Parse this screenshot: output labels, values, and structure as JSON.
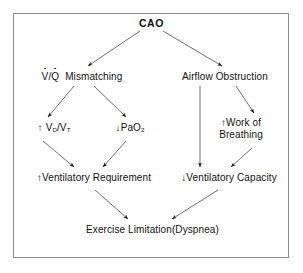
{
  "figure": {
    "type": "flowchart",
    "border_color": "#8c8c8c",
    "background": "#ffffff",
    "text_color": "#111111"
  },
  "nodes": {
    "cao": {
      "label": "CAO",
      "id": "cao"
    },
    "vq_mismatching": {
      "prefix": "V",
      "divider": "/",
      "second": "Q",
      "label": "Mismatching",
      "full": "V̇/Q̇ Mismatching"
    },
    "airflow_obstruction": {
      "label": "Airflow  Obstruction"
    },
    "vd_vt": {
      "arrow": "↑",
      "main_a": "V",
      "sub_a": "D",
      "slash": "/",
      "main_b": "V",
      "sub_b": "T",
      "full": "↑ V_D/V_T"
    },
    "pao2": {
      "arrow": "↓",
      "label": "PaO",
      "sub": "2",
      "full": "↓PaO₂"
    },
    "work_of_breathing": {
      "arrow": "↑",
      "line1": "Work  of",
      "line2": "Breathing",
      "full": "↑ Work of Breathing"
    },
    "ventilatory_requirement": {
      "arrow": "↑",
      "label": "Ventilatory  Requirement",
      "full": "↑Ventilatory Requirement"
    },
    "ventilatory_capacity": {
      "arrow": "↓",
      "label": "Ventilatory  Capacity",
      "full": "↓Ventilatory Capacity"
    },
    "exercise_limitation": {
      "label": "Exercise  Limitation",
      "paren": "(Dyspnea)",
      "full": "Exercise Limitation(Dyspnea)"
    }
  },
  "edges": [
    {
      "from": "cao",
      "to": "vq_mismatching"
    },
    {
      "from": "cao",
      "to": "airflow_obstruction"
    },
    {
      "from": "vq_mismatching",
      "to": "vd_vt"
    },
    {
      "from": "vq_mismatching",
      "to": "pao2"
    },
    {
      "from": "vd_vt",
      "to": "ventilatory_requirement"
    },
    {
      "from": "pao2",
      "to": "ventilatory_requirement"
    },
    {
      "from": "airflow_obstruction",
      "to": "work_of_breathing"
    },
    {
      "from": "airflow_obstruction",
      "to": "ventilatory_capacity"
    },
    {
      "from": "work_of_breathing",
      "to": "ventilatory_capacity"
    },
    {
      "from": "ventilatory_requirement",
      "to": "exercise_limitation"
    },
    {
      "from": "ventilatory_capacity",
      "to": "exercise_limitation"
    }
  ]
}
